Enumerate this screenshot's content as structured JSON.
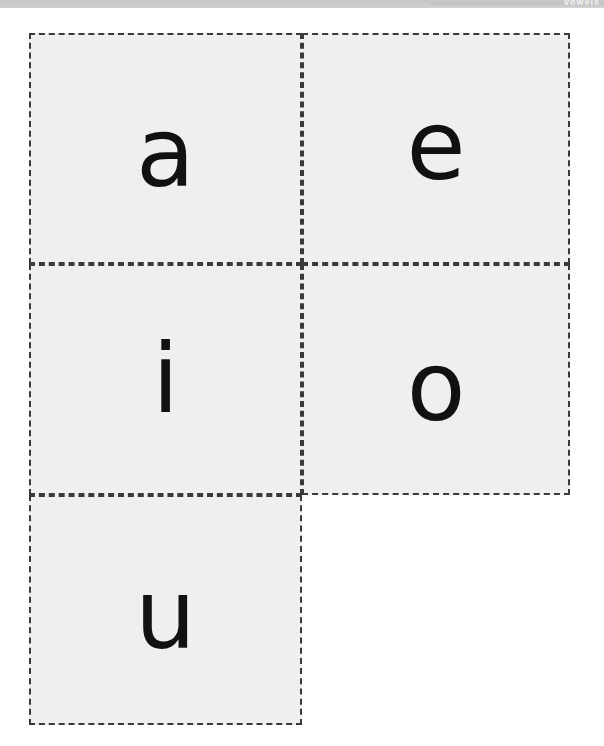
{
  "header": {
    "band_text": "vowels",
    "band_color": "#c6c6c6",
    "band_text_color": "#f2f2f2"
  },
  "page": {
    "background_color": "#ffffff",
    "title": ""
  },
  "cards": {
    "border_style": "dashed",
    "border_color": "#3a3a3a",
    "fill_color": "#eeefee",
    "letter_color": "#111111",
    "items": [
      {
        "letter": "a",
        "row": 1,
        "col": 1,
        "name": "flashcard-a"
      },
      {
        "letter": "e",
        "row": 1,
        "col": 2,
        "name": "flashcard-e"
      },
      {
        "letter": "i",
        "row": 2,
        "col": 1,
        "name": "flashcard-i"
      },
      {
        "letter": "o",
        "row": 2,
        "col": 2,
        "name": "flashcard-o"
      },
      {
        "letter": "u",
        "row": 3,
        "col": 1,
        "name": "flashcard-u"
      }
    ]
  }
}
